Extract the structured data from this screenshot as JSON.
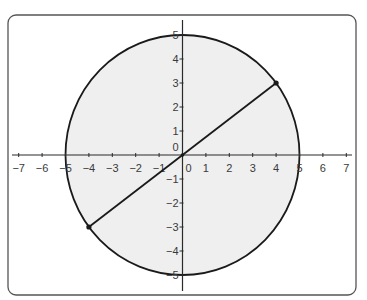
{
  "chart_data": {
    "type": "scatter",
    "title": "",
    "xlabel": "",
    "ylabel": "",
    "xlim": [
      -7,
      7
    ],
    "ylim": [
      -5,
      5
    ],
    "grid": false,
    "legend": null,
    "x_ticks": [
      -7,
      -6,
      -5,
      -4,
      -3,
      -2,
      -1,
      0,
      1,
      2,
      3,
      4,
      5,
      6,
      7
    ],
    "x_tick_labels": [
      "−7",
      "−6",
      "−5",
      "−4",
      "−3",
      "−2",
      "−1",
      "0",
      "1",
      "2",
      "3",
      "4",
      "5",
      "6",
      "7"
    ],
    "y_ticks": [
      5,
      4,
      3,
      2,
      1,
      0,
      -1,
      -2,
      -3,
      -4,
      -5
    ],
    "y_tick_labels": [
      "5",
      "4",
      "3",
      "2",
      "1",
      "0",
      "−1",
      "−2",
      "−3",
      "−4",
      "−5"
    ],
    "shapes": [
      {
        "kind": "circle",
        "name": "circle-radius-5",
        "center": [
          0,
          0
        ],
        "radius": 5,
        "fill": "#efefef",
        "stroke": "#1a1a1a"
      },
      {
        "kind": "segment",
        "name": "diameter",
        "from": [
          -4,
          -3
        ],
        "to": [
          4,
          3
        ],
        "stroke": "#1a1a1a"
      }
    ],
    "points": [
      {
        "name": "point-4-3",
        "x": 4,
        "y": 3
      },
      {
        "name": "point-neg4-neg3",
        "x": -4,
        "y": -3
      }
    ]
  },
  "frame": {
    "border_color": "#555555",
    "background": "#ffffff"
  },
  "colors": {
    "axis": "#2a2a2a",
    "label": "#3a3a3a",
    "circle_fill": "#efefef",
    "stroke": "#1a1a1a"
  }
}
